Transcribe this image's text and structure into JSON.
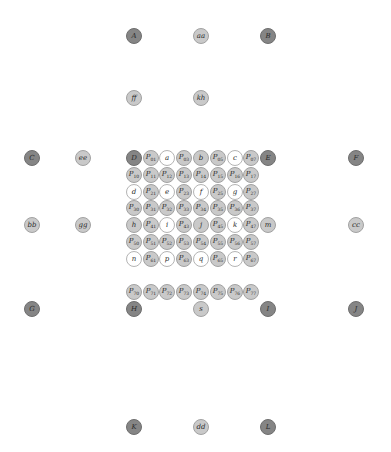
{
  "diagram": {
    "type": "node-grid",
    "colors": {
      "dark": "#858585",
      "light": "#c9c9c9",
      "white": "#ffffff",
      "text": "#2a2a2a"
    },
    "nodes": [
      {
        "id": "A",
        "label": "A",
        "sub": "",
        "x": 134,
        "y": 36,
        "style": "dark"
      },
      {
        "id": "aa",
        "label": "aa",
        "sub": "",
        "x": 201,
        "y": 36,
        "style": "light"
      },
      {
        "id": "B",
        "label": "B",
        "sub": "",
        "x": 268,
        "y": 36,
        "style": "dark"
      },
      {
        "id": "ff",
        "label": "ff",
        "sub": "",
        "x": 134,
        "y": 98,
        "style": "light"
      },
      {
        "id": "kh",
        "label": "kh",
        "sub": "",
        "x": 201,
        "y": 98,
        "style": "light"
      },
      {
        "id": "C",
        "label": "C",
        "sub": "",
        "x": 32,
        "y": 158,
        "style": "dark"
      },
      {
        "id": "ee",
        "label": "ee",
        "sub": "",
        "x": 83,
        "y": 158,
        "style": "light"
      },
      {
        "id": "D",
        "label": "D",
        "sub": "",
        "x": 134,
        "y": 158,
        "style": "dark"
      },
      {
        "id": "P01",
        "label": "P",
        "sub": "01",
        "x": 151,
        "y": 158,
        "style": "light"
      },
      {
        "id": "a",
        "label": "a",
        "sub": "",
        "x": 167,
        "y": 158,
        "style": "white"
      },
      {
        "id": "P03",
        "label": "P",
        "sub": "03",
        "x": 184,
        "y": 158,
        "style": "light"
      },
      {
        "id": "b",
        "label": "b",
        "sub": "",
        "x": 201,
        "y": 158,
        "style": "light"
      },
      {
        "id": "P05",
        "label": "P",
        "sub": "05",
        "x": 218,
        "y": 158,
        "style": "light"
      },
      {
        "id": "c",
        "label": "c",
        "sub": "",
        "x": 235,
        "y": 158,
        "style": "white"
      },
      {
        "id": "P07",
        "label": "P",
        "sub": "07",
        "x": 251,
        "y": 158,
        "style": "light"
      },
      {
        "id": "E",
        "label": "E",
        "sub": "",
        "x": 268,
        "y": 158,
        "style": "dark"
      },
      {
        "id": "F",
        "label": "F",
        "sub": "",
        "x": 356,
        "y": 158,
        "style": "dark"
      },
      {
        "id": "P10",
        "label": "P",
        "sub": "10",
        "x": 134,
        "y": 175,
        "style": "light"
      },
      {
        "id": "P11",
        "label": "P",
        "sub": "11",
        "x": 151,
        "y": 175,
        "style": "light"
      },
      {
        "id": "P12",
        "label": "P",
        "sub": "12",
        "x": 167,
        "y": 175,
        "style": "light"
      },
      {
        "id": "P13",
        "label": "P",
        "sub": "13",
        "x": 184,
        "y": 175,
        "style": "light"
      },
      {
        "id": "P14",
        "label": "P",
        "sub": "14",
        "x": 201,
        "y": 175,
        "style": "light"
      },
      {
        "id": "P15",
        "label": "P",
        "sub": "15",
        "x": 218,
        "y": 175,
        "style": "light"
      },
      {
        "id": "P16",
        "label": "P",
        "sub": "16",
        "x": 235,
        "y": 175,
        "style": "light"
      },
      {
        "id": "P17",
        "label": "P",
        "sub": "17",
        "x": 251,
        "y": 175,
        "style": "light"
      },
      {
        "id": "d",
        "label": "d",
        "sub": "",
        "x": 134,
        "y": 192,
        "style": "white"
      },
      {
        "id": "P21",
        "label": "P",
        "sub": "21",
        "x": 151,
        "y": 192,
        "style": "light"
      },
      {
        "id": "e",
        "label": "e",
        "sub": "",
        "x": 167,
        "y": 192,
        "style": "white"
      },
      {
        "id": "P23",
        "label": "P",
        "sub": "23",
        "x": 184,
        "y": 192,
        "style": "light"
      },
      {
        "id": "f",
        "label": "f",
        "sub": "",
        "x": 201,
        "y": 192,
        "style": "white"
      },
      {
        "id": "P25",
        "label": "P",
        "sub": "25",
        "x": 218,
        "y": 192,
        "style": "light"
      },
      {
        "id": "g",
        "label": "g",
        "sub": "",
        "x": 235,
        "y": 192,
        "style": "white"
      },
      {
        "id": "P27",
        "label": "P",
        "sub": "27",
        "x": 251,
        "y": 192,
        "style": "light"
      },
      {
        "id": "P30",
        "label": "P",
        "sub": "30",
        "x": 134,
        "y": 208,
        "style": "light"
      },
      {
        "id": "P31",
        "label": "P",
        "sub": "31",
        "x": 151,
        "y": 208,
        "style": "light"
      },
      {
        "id": "P32",
        "label": "P",
        "sub": "32",
        "x": 167,
        "y": 208,
        "style": "light"
      },
      {
        "id": "P33",
        "label": "P",
        "sub": "33",
        "x": 184,
        "y": 208,
        "style": "light"
      },
      {
        "id": "P34",
        "label": "P",
        "sub": "34",
        "x": 201,
        "y": 208,
        "style": "light"
      },
      {
        "id": "P35",
        "label": "P",
        "sub": "35",
        "x": 218,
        "y": 208,
        "style": "light"
      },
      {
        "id": "P36",
        "label": "P",
        "sub": "36",
        "x": 235,
        "y": 208,
        "style": "light"
      },
      {
        "id": "P37",
        "label": "P",
        "sub": "37",
        "x": 251,
        "y": 208,
        "style": "light"
      },
      {
        "id": "bb",
        "label": "bb",
        "sub": "",
        "x": 32,
        "y": 225,
        "style": "light"
      },
      {
        "id": "gg",
        "label": "gg",
        "sub": "",
        "x": 83,
        "y": 225,
        "style": "light"
      },
      {
        "id": "h",
        "label": "h",
        "sub": "",
        "x": 134,
        "y": 225,
        "style": "light"
      },
      {
        "id": "P41",
        "label": "P",
        "sub": "41",
        "x": 151,
        "y": 225,
        "style": "light"
      },
      {
        "id": "i",
        "label": "i",
        "sub": "",
        "x": 167,
        "y": 225,
        "style": "white"
      },
      {
        "id": "P43",
        "label": "P",
        "sub": "43",
        "x": 184,
        "y": 225,
        "style": "light"
      },
      {
        "id": "j",
        "label": "j",
        "sub": "",
        "x": 201,
        "y": 225,
        "style": "light"
      },
      {
        "id": "P45",
        "label": "P",
        "sub": "45",
        "x": 218,
        "y": 225,
        "style": "light"
      },
      {
        "id": "k",
        "label": "k",
        "sub": "",
        "x": 235,
        "y": 225,
        "style": "white"
      },
      {
        "id": "P47",
        "label": "P",
        "sub": "47",
        "x": 251,
        "y": 225,
        "style": "light"
      },
      {
        "id": "m",
        "label": "m",
        "sub": "",
        "x": 268,
        "y": 225,
        "style": "light"
      },
      {
        "id": "cc",
        "label": "cc",
        "sub": "",
        "x": 356,
        "y": 225,
        "style": "light"
      },
      {
        "id": "P50",
        "label": "P",
        "sub": "50",
        "x": 134,
        "y": 242,
        "style": "light"
      },
      {
        "id": "P51",
        "label": "P",
        "sub": "51",
        "x": 151,
        "y": 242,
        "style": "light"
      },
      {
        "id": "P52",
        "label": "P",
        "sub": "52",
        "x": 167,
        "y": 242,
        "style": "light"
      },
      {
        "id": "P53",
        "label": "P",
        "sub": "53",
        "x": 184,
        "y": 242,
        "style": "light"
      },
      {
        "id": "P54",
        "label": "P",
        "sub": "54",
        "x": 201,
        "y": 242,
        "style": "light"
      },
      {
        "id": "P55",
        "label": "P",
        "sub": "55",
        "x": 218,
        "y": 242,
        "style": "light"
      },
      {
        "id": "P56",
        "label": "P",
        "sub": "56",
        "x": 235,
        "y": 242,
        "style": "light"
      },
      {
        "id": "P57",
        "label": "P",
        "sub": "57",
        "x": 251,
        "y": 242,
        "style": "light"
      },
      {
        "id": "n",
        "label": "n",
        "sub": "",
        "x": 134,
        "y": 259,
        "style": "white"
      },
      {
        "id": "P61",
        "label": "P",
        "sub": "61",
        "x": 151,
        "y": 259,
        "style": "light"
      },
      {
        "id": "p",
        "label": "p",
        "sub": "",
        "x": 167,
        "y": 259,
        "style": "white"
      },
      {
        "id": "P63",
        "label": "P",
        "sub": "63",
        "x": 184,
        "y": 259,
        "style": "light"
      },
      {
        "id": "q",
        "label": "q",
        "sub": "",
        "x": 201,
        "y": 259,
        "style": "white"
      },
      {
        "id": "P65",
        "label": "P",
        "sub": "65",
        "x": 218,
        "y": 259,
        "style": "light"
      },
      {
        "id": "r",
        "label": "r",
        "sub": "",
        "x": 235,
        "y": 259,
        "style": "white"
      },
      {
        "id": "P67",
        "label": "P",
        "sub": "67",
        "x": 251,
        "y": 259,
        "style": "light"
      },
      {
        "id": "P70",
        "label": "P",
        "sub": "70",
        "x": 134,
        "y": 292,
        "style": "light"
      },
      {
        "id": "P71",
        "label": "P",
        "sub": "71",
        "x": 151,
        "y": 292,
        "style": "light"
      },
      {
        "id": "P72",
        "label": "P",
        "sub": "72",
        "x": 167,
        "y": 292,
        "style": "light"
      },
      {
        "id": "P73",
        "label": "P",
        "sub": "73",
        "x": 184,
        "y": 292,
        "style": "light"
      },
      {
        "id": "P74",
        "label": "P",
        "sub": "74",
        "x": 201,
        "y": 292,
        "style": "light"
      },
      {
        "id": "P75",
        "label": "P",
        "sub": "75",
        "x": 218,
        "y": 292,
        "style": "light"
      },
      {
        "id": "P76",
        "label": "P",
        "sub": "76",
        "x": 235,
        "y": 292,
        "style": "light"
      },
      {
        "id": "P77",
        "label": "P",
        "sub": "77",
        "x": 251,
        "y": 292,
        "style": "light"
      },
      {
        "id": "G",
        "label": "G",
        "sub": "",
        "x": 32,
        "y": 309,
        "style": "dark"
      },
      {
        "id": "H",
        "label": "H",
        "sub": "",
        "x": 134,
        "y": 309,
        "style": "dark"
      },
      {
        "id": "s",
        "label": "s",
        "sub": "",
        "x": 201,
        "y": 309,
        "style": "light"
      },
      {
        "id": "I",
        "label": "I",
        "sub": "",
        "x": 268,
        "y": 309,
        "style": "dark"
      },
      {
        "id": "J",
        "label": "J",
        "sub": "",
        "x": 356,
        "y": 309,
        "style": "dark"
      },
      {
        "id": "K",
        "label": "K",
        "sub": "",
        "x": 134,
        "y": 427,
        "style": "dark"
      },
      {
        "id": "dd",
        "label": "dd",
        "sub": "",
        "x": 201,
        "y": 427,
        "style": "light"
      },
      {
        "id": "L",
        "label": "L",
        "sub": "",
        "x": 268,
        "y": 427,
        "style": "dark"
      }
    ]
  }
}
